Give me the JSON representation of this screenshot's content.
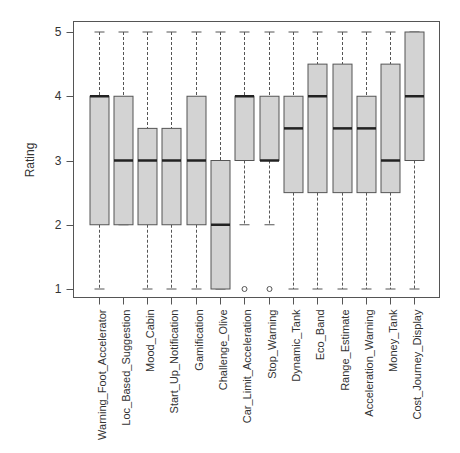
{
  "chart_data": {
    "type": "boxplot",
    "title": "",
    "xlabel": "",
    "ylabel": "Rating",
    "ylim": [
      1,
      5
    ],
    "yticks": [
      1,
      2,
      3,
      4,
      5
    ],
    "grid": false,
    "legend": null,
    "categories": [
      "Warning_Foot_Accelerator",
      "Loc_Based_Suggestion",
      "Mood_Cabin",
      "Start_Up_Notification",
      "Gamification",
      "Challenge_Olive",
      "Car_Limit_Acceleration",
      "Stop_Warning",
      "Dynamic_Tank",
      "Eco_Band",
      "Range_Estimate",
      "Acceleration_Warning",
      "Money_Tank",
      "Cost_Journey_Display"
    ],
    "boxes": [
      {
        "label": "Warning_Foot_Accelerator",
        "whisker_low": 1,
        "q1": 2,
        "median": 4,
        "q3": 4,
        "whisker_high": 5,
        "outliers": []
      },
      {
        "label": "Loc_Based_Suggestion",
        "whisker_low": 2,
        "q1": 2,
        "median": 3,
        "q3": 4,
        "whisker_high": 5,
        "outliers": []
      },
      {
        "label": "Mood_Cabin",
        "whisker_low": 1,
        "q1": 2,
        "median": 3,
        "q3": 3.5,
        "whisker_high": 5,
        "outliers": []
      },
      {
        "label": "Start_Up_Notification",
        "whisker_low": 1,
        "q1": 2,
        "median": 3,
        "q3": 3.5,
        "whisker_high": 5,
        "outliers": []
      },
      {
        "label": "Gamification",
        "whisker_low": 1,
        "q1": 2,
        "median": 3,
        "q3": 4,
        "whisker_high": 5,
        "outliers": []
      },
      {
        "label": "Challenge_Olive",
        "whisker_low": 1,
        "q1": 1,
        "median": 2,
        "q3": 3,
        "whisker_high": 5,
        "outliers": []
      },
      {
        "label": "Car_Limit_Acceleration",
        "whisker_low": 2,
        "q1": 3,
        "median": 4,
        "q3": 4,
        "whisker_high": 5,
        "outliers": [
          1
        ]
      },
      {
        "label": "Stop_Warning",
        "whisker_low": 2,
        "q1": 3,
        "median": 3,
        "q3": 4,
        "whisker_high": 5,
        "outliers": [
          1
        ]
      },
      {
        "label": "Dynamic_Tank",
        "whisker_low": 1,
        "q1": 2.5,
        "median": 3.5,
        "q3": 4,
        "whisker_high": 5,
        "outliers": []
      },
      {
        "label": "Eco_Band",
        "whisker_low": 1,
        "q1": 2.5,
        "median": 4,
        "q3": 4.5,
        "whisker_high": 5,
        "outliers": []
      },
      {
        "label": "Range_Estimate",
        "whisker_low": 1,
        "q1": 2.5,
        "median": 3.5,
        "q3": 4.5,
        "whisker_high": 5,
        "outliers": []
      },
      {
        "label": "Acceleration_Warning",
        "whisker_low": 1,
        "q1": 2.5,
        "median": 3.5,
        "q3": 4,
        "whisker_high": 5,
        "outliers": []
      },
      {
        "label": "Money_Tank",
        "whisker_low": 1,
        "q1": 2.5,
        "median": 3,
        "q3": 4.5,
        "whisker_high": 5,
        "outliers": []
      },
      {
        "label": "Cost_Journey_Display",
        "whisker_low": 1,
        "q1": 3,
        "median": 4,
        "q3": 5,
        "whisker_high": 5,
        "outliers": []
      }
    ],
    "colors": {
      "box_fill": "#d3d3d3",
      "box_stroke": "#555555",
      "median": "#222222"
    }
  }
}
